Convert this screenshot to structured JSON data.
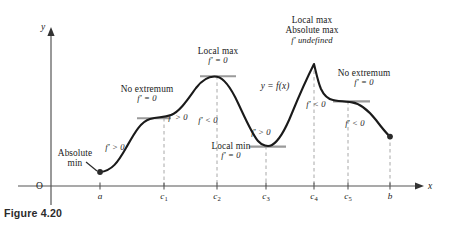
{
  "figure": {
    "caption": "Figure 4.20",
    "curve_label": "y = f(x)",
    "axes": {
      "y_label": "y",
      "x_label": "x",
      "origin_label": "O"
    },
    "colors": {
      "curve": "#1a1a1a",
      "axis": "#555555",
      "tangent": "#9a9a9a",
      "dashed_guide": "#a8a8a8",
      "text": "#1a1a1a",
      "caption": "#2b2b2b"
    },
    "tick_labels": [
      {
        "name": "a",
        "text": "a",
        "sub": "",
        "x": 100
      },
      {
        "name": "c1",
        "text": "c",
        "sub": "1",
        "x": 164
      },
      {
        "name": "c2",
        "text": "c",
        "sub": "2",
        "x": 217
      },
      {
        "name": "c3",
        "text": "c",
        "sub": "3",
        "x": 266
      },
      {
        "name": "c4",
        "text": "c",
        "sub": "4",
        "x": 314
      },
      {
        "name": "c5",
        "text": "c",
        "sub": "5",
        "x": 348
      },
      {
        "name": "b",
        "text": "b",
        "sub": "",
        "x": 390
      }
    ],
    "annotations": [
      {
        "name": "absolute-min",
        "lines": [
          "Absolute",
          "min"
        ],
        "x": 75,
        "y": 148
      },
      {
        "name": "no-extremum-c1",
        "lines": [
          "No extremum",
          "f′ = 0"
        ],
        "x": 147,
        "y": 84
      },
      {
        "name": "local-max-c2",
        "lines": [
          "Local max",
          "f′ = 0"
        ],
        "x": 218,
        "y": 46
      },
      {
        "name": "local-min-c3",
        "lines": [
          "Local min",
          "f′ = 0"
        ],
        "x": 231,
        "y": 141
      },
      {
        "name": "local-max-absolute-max-c4",
        "lines": [
          "Local max",
          "Absolute max",
          "f′ undefined"
        ],
        "x": 312,
        "y": 15
      },
      {
        "name": "no-extremum-c5",
        "lines": [
          "No extremum",
          "f′ = 0"
        ],
        "x": 364,
        "y": 68
      }
    ],
    "derivative_signs": [
      {
        "name": "fprime-pos-a-c1",
        "text": "f′ > 0",
        "x": 115,
        "y": 143
      },
      {
        "name": "fprime-pos-c1-c2",
        "text": "f′ > 0",
        "x": 178,
        "y": 113
      },
      {
        "name": "fprime-neg-c2-c3",
        "text": "f′ < 0",
        "x": 208,
        "y": 116
      },
      {
        "name": "fprime-pos-c3-c4",
        "text": "f′ > 0",
        "x": 261,
        "y": 128
      },
      {
        "name": "fprime-neg-c4-c5",
        "text": "f′ < 0",
        "x": 316,
        "y": 100
      },
      {
        "name": "fprime-neg-c5-b",
        "text": "f′ < 0",
        "x": 355,
        "y": 119
      }
    ],
    "geometry": {
      "x_axis_y": 186,
      "y_axis_x": 51,
      "y_axis_top": 28,
      "x_axis_right": 424,
      "curve_path": "M 100 172 C 112 171 118 162 126 148 C 134 134 140 122 150 119 C 158 116.5 163 118 171 115 C 180 111.6 188 99 196 88 C 203 79 210 75.6 217 76.8 C 224 78 231 88 238 103 C 246 120 252 134 258 141 C 262 145.6 268 147.2 272 145 C 279 141 286 128 292 113 C 299 96 306 80 314 64 C 316 72 318 82 321 89 C 324 95.5 328 99 333 100 C 339 101.2 345 101.6 352 102.4 C 360 103.4 368 110 376 120 C 382 128 386 133 390 136.6",
      "endpoint_dots": [
        {
          "name": "dot-at-a",
          "x": 100,
          "y": 172
        },
        {
          "name": "dot-at-b",
          "x": 390,
          "y": 136.6
        }
      ],
      "tangent_segments": [
        {
          "name": "tangent-c1",
          "x1": 137,
          "x2": 171,
          "y": 118.2
        },
        {
          "name": "tangent-c2",
          "x1": 200,
          "x2": 236,
          "y": 76.2
        },
        {
          "name": "tangent-c3",
          "x1": 249,
          "x2": 286,
          "y": 146.6
        },
        {
          "name": "tangent-c5",
          "x1": 333,
          "x2": 370,
          "y": 101.4
        }
      ],
      "dashed_guides": [
        {
          "name": "guide-c1",
          "x": 164,
          "y_top": 118,
          "y_bottom": 186
        },
        {
          "name": "guide-c2",
          "x": 217,
          "y_top": 76,
          "y_bottom": 186
        },
        {
          "name": "guide-c3",
          "x": 266,
          "y_top": 146,
          "y_bottom": 186
        },
        {
          "name": "guide-c4",
          "x": 314,
          "y_top": 64,
          "y_bottom": 186
        },
        {
          "name": "guide-c5",
          "x": 348,
          "y_top": 101,
          "y_bottom": 186
        },
        {
          "name": "guide-b",
          "x": 390,
          "y_top": 136,
          "y_bottom": 186
        }
      ],
      "ticks": [
        100,
        164,
        217,
        266,
        314,
        348,
        390
      ]
    }
  }
}
